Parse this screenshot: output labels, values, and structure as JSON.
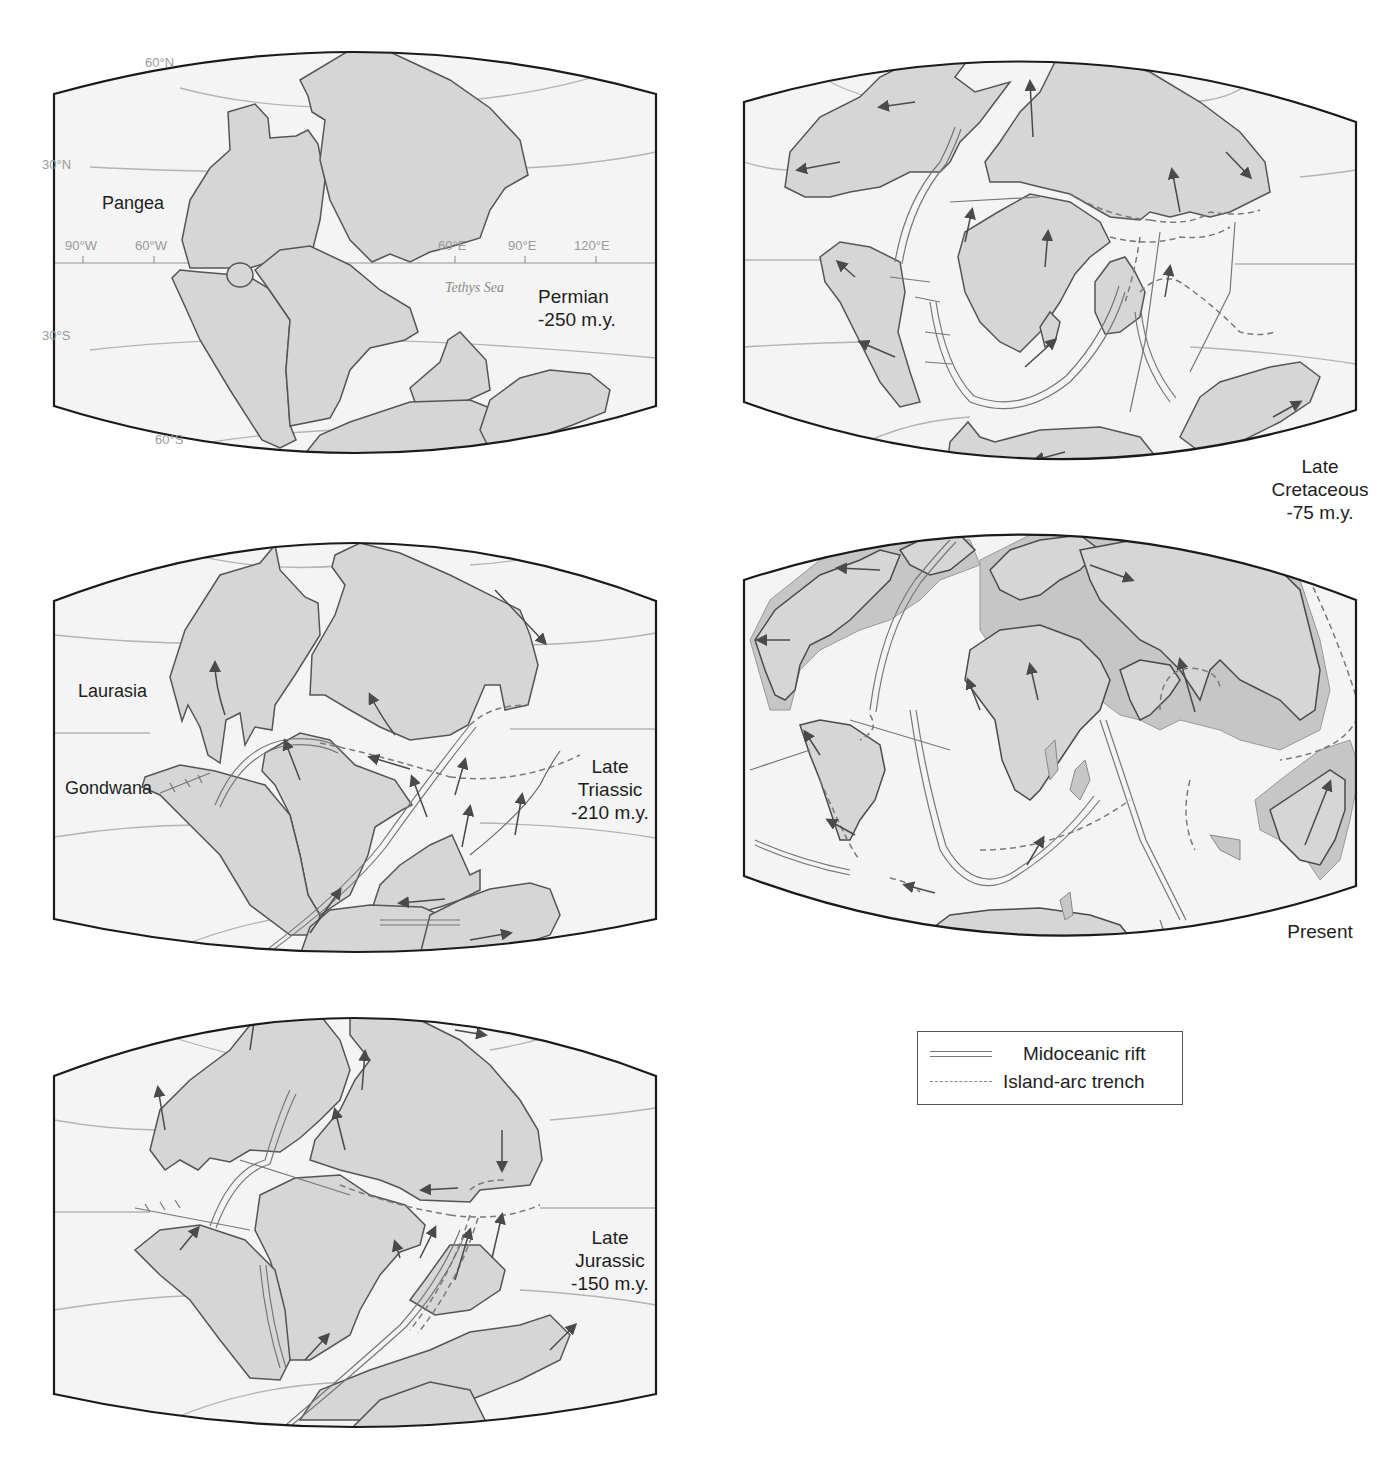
{
  "figure": {
    "colors": {
      "land": "#d6d6d6",
      "ocean": "#f4f4f4",
      "coast": "#555555",
      "frame": "#1a1a1a",
      "grid": "#b4b4b4",
      "rift": "#777777",
      "trench": "#7a7a7a",
      "arrow": "#4a4a4a",
      "shelf": "#c2c2c2"
    },
    "panels": [
      {
        "id": "permian",
        "period": "Permian",
        "age": "-250 m.y.",
        "supercontinent_label": "Pangea",
        "sea_label": "Tethys Sea",
        "latitude_labels": [
          "60°N",
          "30°N",
          "30°S",
          "60°S"
        ],
        "longitude_labels": [
          "90°W",
          "60°W",
          "60°E",
          "90°E",
          "120°E"
        ]
      },
      {
        "id": "late-triassic",
        "period_line1": "Late",
        "period_line2": "Triassic",
        "age": "-210 m.y.",
        "north_label": "Laurasia",
        "south_label": "Gondwana"
      },
      {
        "id": "late-jurassic",
        "period_line1": "Late",
        "period_line2": "Jurassic",
        "age": "-150 m.y."
      },
      {
        "id": "late-cretaceous",
        "period_line1": "Late",
        "period_line2": "Cretaceous",
        "age": "-75 m.y."
      },
      {
        "id": "present",
        "period": "Present"
      }
    ],
    "legend": {
      "items": [
        {
          "symbol": "double-line",
          "label": "Midoceanic rift"
        },
        {
          "symbol": "dashed-line",
          "label": "Island-arc trench"
        }
      ]
    }
  }
}
